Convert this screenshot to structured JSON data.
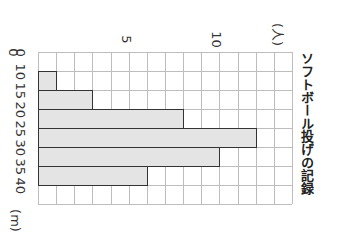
{
  "chart_data": {
    "type": "bar",
    "orientation": "histogram rendered rotated 90° clockwise",
    "title": "ソフトボール投げの記録",
    "xlabel": "(m)",
    "ylabel": "(人)",
    "categories": [
      "10-15",
      "15-20",
      "20-25",
      "25-30",
      "30-35",
      "35-40"
    ],
    "values": [
      1,
      3,
      8,
      12,
      10,
      6
    ],
    "x_tick_labels": [
      "0",
      "10",
      "15",
      "20",
      "25",
      "30",
      "35",
      "40"
    ],
    "y_tick_labels": [
      "0",
      "5",
      "10"
    ],
    "ylim": [
      0,
      14
    ],
    "grid": true,
    "legend": null
  },
  "labels": {
    "title": "ソフトボール投げの記録",
    "y_unit": "(人)",
    "x_unit": "(m)",
    "y_ticks": [
      {
        "label": "0",
        "value": 0
      },
      {
        "label": "5",
        "value": 5
      },
      {
        "label": "10",
        "value": 10
      }
    ],
    "x_ticks": [
      "0",
      "10",
      "15",
      "20",
      "25",
      "30",
      "35",
      "40"
    ]
  },
  "colors": {
    "bar_fill": "#e4e4e4",
    "bar_border": "#333333",
    "grid": "#bdbdbd"
  }
}
